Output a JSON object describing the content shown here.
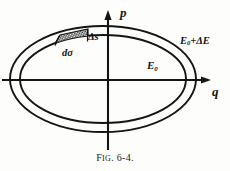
{
  "figure": {
    "caption_prefix": "F",
    "caption_prefix_rest": "IG",
    "caption_number": ". 6-4.",
    "caption_full": "FIG. 6-4."
  },
  "axes": {
    "vertical_label": "p",
    "horizontal_label": "q",
    "origin": {
      "x": 108,
      "y": 80
    }
  },
  "labels": {
    "delta_s": "Δs",
    "d_sigma": "dσ",
    "energy_inner": "E",
    "energy_inner_sub": "0",
    "energy_outer_lead": "E",
    "energy_outer_sub": "0",
    "energy_outer_tail": "+ΔE"
  },
  "colors": {
    "ink": "#141414",
    "paper": "#fdfdfb",
    "hatch": "#2a2a2a"
  },
  "geometry": {
    "outer_ellipse": {
      "cx": 103,
      "cy": 79,
      "rx": 93,
      "ry": 53
    },
    "inner_ellipse": {
      "cx": 103,
      "cy": 79,
      "rx": 83,
      "ry": 44
    },
    "patch_label": "hatched-area-element"
  }
}
